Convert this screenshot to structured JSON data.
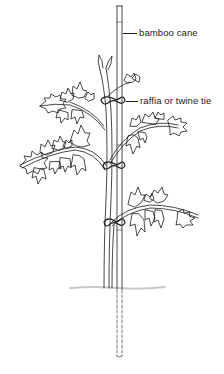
{
  "diagram": {
    "labels": [
      {
        "id": "cane",
        "text": "bamboo cane",
        "x": 139,
        "y": 27,
        "leader_from": 123,
        "leader_to": 137,
        "leader_y": 33
      },
      {
        "id": "tie",
        "text": "raffia or twine tie",
        "x": 140,
        "y": 95,
        "leader_from": 126,
        "leader_to": 138,
        "leader_y": 101
      }
    ],
    "ties_y": [
      100,
      165,
      222
    ],
    "ground_y": 288,
    "colors": {
      "ink": "#1a1a1a",
      "background": "#ffffff",
      "ground": "#c8c8c8"
    }
  }
}
